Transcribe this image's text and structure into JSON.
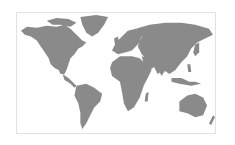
{
  "map": {
    "type": "world-map",
    "projection": "equirectangular",
    "land_color": "#8a8a8a",
    "water_color": "#ffffff",
    "border_color": "#e2e2e2",
    "regions": [
      "North America",
      "Greenland",
      "South America",
      "Europe",
      "Africa",
      "Asia",
      "Australia",
      "New Zealand",
      "Antarctica-excluded"
    ],
    "alt_label": "World map"
  }
}
